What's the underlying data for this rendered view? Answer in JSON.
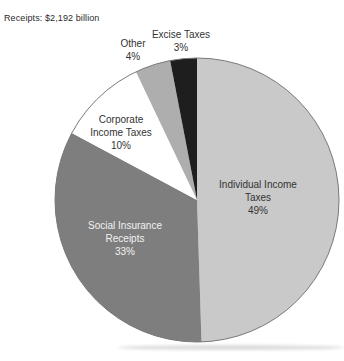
{
  "header": {
    "receipts_label": "Receipts: $2,192 billion"
  },
  "chart_data": {
    "type": "pie",
    "title": "Receipts: $2,192 billion",
    "total_value": "$2,192 billion",
    "direction": "clockwise",
    "start_angle_deg": 0,
    "outline_color": "#7a7a7a",
    "background_color": "#ffffff",
    "slices": [
      {
        "label": "Individual Income Taxes",
        "pct": 49,
        "pct_label": "49%",
        "color": "#c9c9c9",
        "text_color": "#333333",
        "label_position": "inside"
      },
      {
        "label": "Social Insurance Receipts",
        "pct": 33,
        "pct_label": "33%",
        "color": "#7e7e7e",
        "text_color": "#f2f2f2",
        "label_position": "inside"
      },
      {
        "label": "Corporate Income Taxes",
        "pct": 10,
        "pct_label": "10%",
        "color": "#ffffff",
        "text_color": "#333333",
        "label_position": "inside"
      },
      {
        "label": "Other",
        "pct": 4,
        "pct_label": "4%",
        "color": "#aeaeae",
        "text_color": "#333333",
        "label_position": "outside"
      },
      {
        "label": "Excise Taxes",
        "pct": 3,
        "pct_label": "3%",
        "color": "#1e1e1e",
        "text_color": "#333333",
        "label_position": "outside"
      }
    ]
  }
}
